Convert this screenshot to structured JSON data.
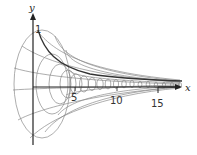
{
  "figure": {
    "axes": {
      "x_label": "x",
      "y_label": "y",
      "x_ticks": [
        "5",
        "10",
        "15"
      ],
      "y_ticks": [
        "1"
      ]
    },
    "colors": {
      "mesh": "#8a8a8a",
      "curve": "#333333",
      "axis": "#222222"
    }
  }
}
